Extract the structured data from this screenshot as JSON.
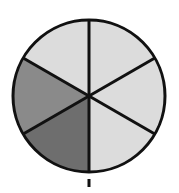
{
  "figure": {
    "name": "fraction-circle",
    "background_color": "#ffffff",
    "outline_color": "#111111",
    "outline_width": 3,
    "divider_color": "#111111",
    "divider_width": 3,
    "center_x": 89,
    "center_y": 96,
    "radius": 76
  },
  "chart_data": {
    "type": "pie",
    "xlabel": "",
    "ylabel": "",
    "total_slices": 6,
    "slice_value": 1,
    "slice_fraction": "1/6",
    "slice_degrees": 60,
    "shaded_count": 2,
    "unshaded_count": 4,
    "shaded_fraction": "2/6",
    "legend_position": "none",
    "grid": false,
    "categories": [
      "top-right",
      "right",
      "bottom-right",
      "bottom-left",
      "left",
      "top-left"
    ],
    "values": [
      1,
      1,
      1,
      1,
      1,
      1
    ],
    "slices": [
      {
        "id": "sector-top-right",
        "label": "top-right",
        "start_angle": -90,
        "end_angle": -30,
        "degrees": 60,
        "fill": "#dcdcdc",
        "shade": "light",
        "shaded": false
      },
      {
        "id": "sector-right",
        "label": "right",
        "start_angle": -30,
        "end_angle": 30,
        "degrees": 60,
        "fill": "#dcdcdc",
        "shade": "light",
        "shaded": false
      },
      {
        "id": "sector-bottom-right",
        "label": "bottom-right",
        "start_angle": 30,
        "end_angle": 90,
        "degrees": 60,
        "fill": "#dcdcdc",
        "shade": "light",
        "shaded": false
      },
      {
        "id": "sector-bottom-left",
        "label": "bottom-left",
        "start_angle": 90,
        "end_angle": 150,
        "degrees": 60,
        "fill": "#6e6e6e",
        "shade": "dark",
        "shaded": true
      },
      {
        "id": "sector-left",
        "label": "left",
        "start_angle": 150,
        "end_angle": 210,
        "degrees": 60,
        "fill": "#8a8a8a",
        "shade": "medium",
        "shaded": true
      },
      {
        "id": "sector-top-left",
        "label": "top-left",
        "start_angle": 210,
        "end_angle": 270,
        "degrees": 60,
        "fill": "#dcdcdc",
        "shade": "light",
        "shaded": false
      }
    ]
  },
  "tick_mark": {
    "label": "",
    "x": 89,
    "y": 179,
    "width": 3,
    "height": 8,
    "color": "#111111"
  }
}
